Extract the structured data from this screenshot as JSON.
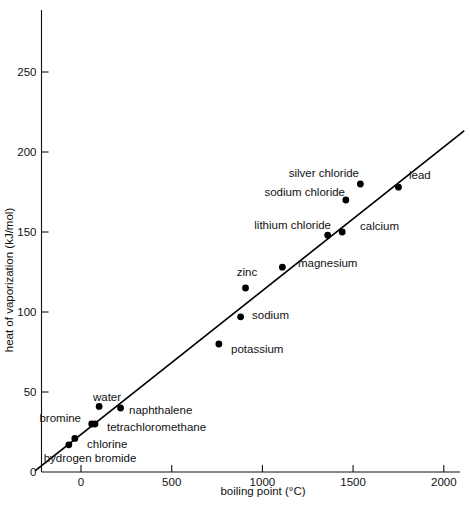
{
  "chart_data": {
    "type": "scatter",
    "title": "",
    "xlabel": "boiling point (°C)",
    "ylabel": "heat of vaporization (kJ/mol)",
    "xlim": [
      -250,
      2100
    ],
    "ylim": [
      0,
      275
    ],
    "xticks": [
      0,
      500,
      1000,
      1500,
      2000
    ],
    "xtick_labels": [
      "0",
      "500",
      "1000",
      "1500",
      "2000"
    ],
    "yticks": [
      0,
      50,
      100,
      150,
      200,
      250
    ],
    "ytick_labels": [
      "0",
      "50",
      "100",
      "150",
      "200",
      "250"
    ],
    "grid": false,
    "legend": false,
    "points": [
      {
        "label": "hydrogen bromide",
        "x": -67,
        "y": 17,
        "lx": 90,
        "ly": 462,
        "anchor": "mid"
      },
      {
        "label": "chlorine",
        "x": -34,
        "y": 21,
        "lx": 87,
        "ly": 448,
        "anchor": "lend"
      },
      {
        "label": "bromine",
        "x": 59,
        "y": 30,
        "lx": 81,
        "ly": 422,
        "anchor": "rend"
      },
      {
        "label": "tetrachloromethane",
        "x": 77,
        "y": 30,
        "lx": 107,
        "ly": 431,
        "anchor": "lend"
      },
      {
        "label": "water",
        "x": 100,
        "y": 41,
        "lx": 107,
        "ly": 401,
        "anchor": "mid"
      },
      {
        "label": "naphthalene",
        "x": 218,
        "y": 40,
        "lx": 129,
        "ly": 414,
        "anchor": "lend"
      },
      {
        "label": "potassium",
        "x": 760,
        "y": 80,
        "lx": 231,
        "ly": 353,
        "anchor": "lend"
      },
      {
        "label": "sodium",
        "x": 880,
        "y": 97,
        "lx": 252,
        "ly": 319,
        "anchor": "lend"
      },
      {
        "label": "zinc",
        "x": 907,
        "y": 115,
        "lx": 247,
        "ly": 276,
        "anchor": "mid"
      },
      {
        "label": "magnesium",
        "x": 1110,
        "y": 128,
        "lx": 298,
        "ly": 267,
        "anchor": "lend"
      },
      {
        "label": "lithium chloride",
        "x": 1360,
        "y": 148,
        "lx": 331,
        "ly": 229,
        "anchor": "rend"
      },
      {
        "label": "calcium",
        "x": 1440,
        "y": 150,
        "lx": 360,
        "ly": 230,
        "anchor": "lend"
      },
      {
        "label": "sodium chloride",
        "x": 1460,
        "y": 170,
        "lx": 345,
        "ly": 196,
        "anchor": "rend"
      },
      {
        "label": "silver chloride",
        "x": 1540,
        "y": 180,
        "lx": 359,
        "ly": 177,
        "anchor": "rend"
      },
      {
        "label": "lead",
        "x": 1750,
        "y": 178,
        "lx": 409,
        "ly": 179,
        "anchor": "lend"
      }
    ],
    "trend_line": {
      "x_start": -250,
      "y_start": 1,
      "x_end": 2110,
      "y_end": 213
    }
  }
}
